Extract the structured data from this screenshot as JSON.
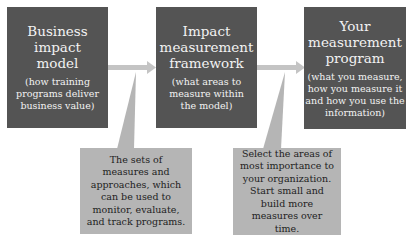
{
  "diagram": {
    "boxes": [
      {
        "title": "Business impact model",
        "subtitle": "(how training programs deliver business value)"
      },
      {
        "title": "Impact measurement framework",
        "subtitle": "(what areas to measure within the model)"
      },
      {
        "title": "Your measurement program",
        "subtitle": "(what you measure, how you measure it and how you use the information)"
      }
    ],
    "callouts": [
      {
        "text": "The sets of measures and approaches, which can be used to monitor, evaluate, and track programs."
      },
      {
        "text": "Select the areas of most importance to your organization. Start small and build more measures over time."
      }
    ],
    "colors": {
      "box_fill": "#545454",
      "box_text": "#f2f2f2",
      "arrow": "#c4c4c4",
      "callout_fill": "#b5b5b5",
      "callout_text": "#1e1e1e"
    }
  }
}
